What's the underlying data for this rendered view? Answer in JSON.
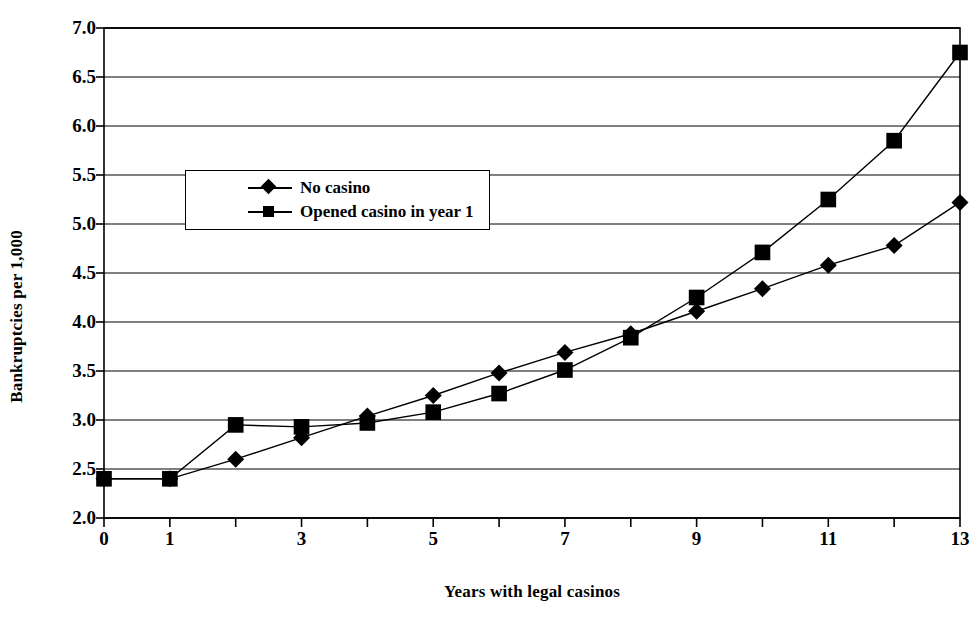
{
  "chart_data": {
    "type": "line",
    "title": "",
    "xlabel": "Years with legal casinos",
    "ylabel": "Bankruptcies per 1,000",
    "x": [
      0,
      1,
      2,
      3,
      4,
      5,
      6,
      7,
      8,
      9,
      10,
      11,
      12,
      13
    ],
    "xlim": [
      0,
      13
    ],
    "ylim": [
      2.0,
      7.0
    ],
    "y_ticks": [
      "2.0",
      "2.5",
      "3.0",
      "3.5",
      "4.0",
      "4.5",
      "5.0",
      "5.5",
      "6.0",
      "6.5",
      "7.0"
    ],
    "x_ticks_major": [
      "0",
      "1",
      "3",
      "5",
      "7",
      "9",
      "11",
      "13"
    ],
    "x_ticks_major_values": [
      0,
      1,
      3,
      5,
      7,
      9,
      11,
      13
    ],
    "grid": "horizontal",
    "legend_position": "upper-left-inside",
    "series": [
      {
        "name": "No casino",
        "marker": "diamond",
        "values": [
          2.4,
          2.4,
          2.6,
          2.82,
          3.04,
          3.25,
          3.48,
          3.69,
          3.88,
          4.11,
          4.34,
          4.58,
          4.78,
          5.22
        ]
      },
      {
        "name": "Opened casino in year 1",
        "marker": "square",
        "values": [
          2.4,
          2.4,
          2.95,
          2.93,
          2.97,
          3.08,
          3.27,
          3.51,
          3.84,
          4.25,
          4.71,
          5.25,
          5.85,
          6.75
        ]
      }
    ],
    "colors": {
      "series": "#000000",
      "axis": "#000000",
      "grid": "#000000",
      "background": "#ffffff"
    }
  }
}
